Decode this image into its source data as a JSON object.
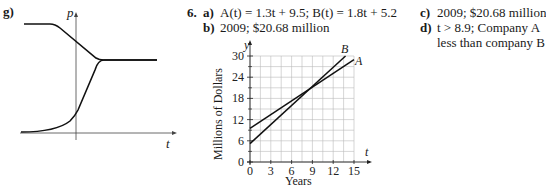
{
  "problem_g": {
    "label": "g)",
    "axis_y_label": "p",
    "axis_x_label": "t",
    "curves": [
      {
        "name": "decreasing-curve",
        "description": "starts high and flat, decreases linearly, levels off at equilibrium"
      },
      {
        "name": "increasing-curve",
        "description": "starts low near zero, rises exponentially, levels off at equilibrium"
      }
    ]
  },
  "problem_6": {
    "number": "6.",
    "parts": [
      {
        "label": "a)",
        "text": "A(t) = 1.3t + 9.5; B(t) = 1.8t + 5.2"
      },
      {
        "label": "b)",
        "text": "2009; $20.68 million"
      },
      {
        "label": "c)",
        "text": "2009; $20.68 million"
      },
      {
        "label": "d)",
        "text": "t > 8.9; Company A",
        "text_line2": "less than company B"
      }
    ]
  },
  "chart_data": {
    "type": "line",
    "title": "",
    "xlabel": "Years",
    "ylabel": "Millions of Dollars",
    "x_axis_letter": "t",
    "y_axis_letter": "y",
    "xlim": [
      0,
      15
    ],
    "ylim": [
      0,
      30
    ],
    "x_ticks": [
      0,
      3,
      6,
      9,
      12,
      15
    ],
    "y_ticks": [
      0,
      6,
      12,
      18,
      24,
      30
    ],
    "grid": true,
    "series": [
      {
        "name": "A",
        "equation": "A(t) = 1.3t + 9.5",
        "x": [
          0,
          15
        ],
        "values": [
          9.5,
          29.0
        ]
      },
      {
        "name": "B",
        "equation": "B(t) = 1.8t + 5.2",
        "x": [
          0,
          13.78
        ],
        "values": [
          5.2,
          30.0
        ]
      }
    ],
    "intersection": {
      "t": 8.6,
      "y": 20.68
    }
  }
}
